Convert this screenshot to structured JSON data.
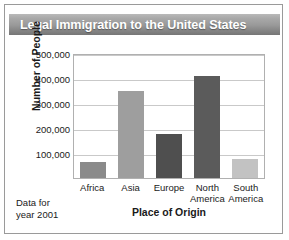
{
  "figure": {
    "title": "Legal Immigration to the United States",
    "note_line1": "Data for",
    "note_line2": "year 2001",
    "border_color": "#9a9a9a",
    "title_text_color": "#ffffff"
  },
  "chart_data": {
    "type": "bar",
    "title": "Legal Immigration to the United States",
    "xlabel": "Place of Origin",
    "ylabel": "Number of People",
    "categories": [
      "Africa",
      "Asia",
      "Europe",
      "North America",
      "South America"
    ],
    "values": [
      65000,
      350000,
      175000,
      410000,
      75000
    ],
    "value_labels": [
      "65,000",
      "350,000",
      "175,000",
      "410,000",
      "75,000"
    ],
    "bar_colors": [
      "#8a8a8a",
      "#9e9e9e",
      "#4f4f4f",
      "#5b5b5b",
      "#c2c2c2"
    ],
    "ylim": [
      0,
      500000
    ],
    "yticks": [
      100000,
      200000,
      300000,
      400000,
      500000
    ],
    "ytick_labels": [
      "100,000",
      "200,000",
      "300,000",
      "400,000",
      "500,000"
    ],
    "grid": true,
    "legend": false,
    "annotation": "Data for year 2001"
  }
}
